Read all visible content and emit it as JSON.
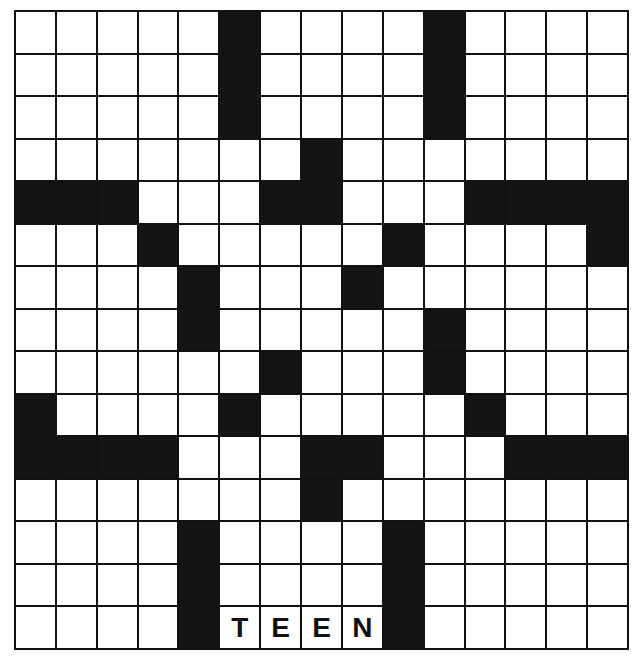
{
  "puzzle": {
    "rows": 15,
    "cols": 15,
    "colors": {
      "black": "#141414",
      "white": "#ffffff",
      "line": "#111111"
    },
    "black_cells": [
      [
        0,
        5
      ],
      [
        0,
        10
      ],
      [
        1,
        5
      ],
      [
        1,
        10
      ],
      [
        2,
        5
      ],
      [
        2,
        10
      ],
      [
        3,
        7
      ],
      [
        4,
        0
      ],
      [
        4,
        1
      ],
      [
        4,
        2
      ],
      [
        4,
        6
      ],
      [
        4,
        7
      ],
      [
        4,
        11
      ],
      [
        4,
        12
      ],
      [
        4,
        13
      ],
      [
        4,
        14
      ],
      [
        5,
        3
      ],
      [
        5,
        9
      ],
      [
        5,
        14
      ],
      [
        6,
        4
      ],
      [
        6,
        8
      ],
      [
        7,
        4
      ],
      [
        7,
        10
      ],
      [
        8,
        6
      ],
      [
        8,
        10
      ],
      [
        9,
        0
      ],
      [
        9,
        5
      ],
      [
        9,
        11
      ],
      [
        10,
        0
      ],
      [
        10,
        1
      ],
      [
        10,
        2
      ],
      [
        10,
        3
      ],
      [
        10,
        7
      ],
      [
        10,
        8
      ],
      [
        10,
        12
      ],
      [
        10,
        13
      ],
      [
        10,
        14
      ],
      [
        11,
        7
      ],
      [
        12,
        4
      ],
      [
        12,
        9
      ],
      [
        13,
        4
      ],
      [
        13,
        9
      ],
      [
        14,
        4
      ],
      [
        14,
        9
      ]
    ],
    "filled_letters": [
      {
        "row": 14,
        "col": 5,
        "letter": "T"
      },
      {
        "row": 14,
        "col": 6,
        "letter": "E"
      },
      {
        "row": 14,
        "col": 7,
        "letter": "E"
      },
      {
        "row": 14,
        "col": 8,
        "letter": "N"
      }
    ]
  }
}
